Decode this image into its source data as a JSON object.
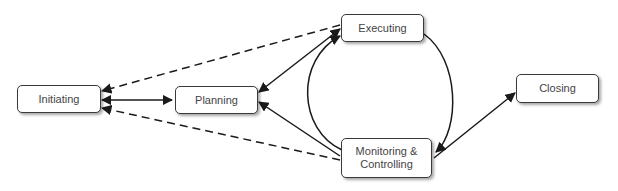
{
  "diagram": {
    "nodes": [
      {
        "id": "initiating",
        "label": "Initiating"
      },
      {
        "id": "planning",
        "label": "Planning"
      },
      {
        "id": "executing",
        "label": "Executing"
      },
      {
        "id": "monitoring",
        "label": "Monitoring & Controlling"
      },
      {
        "id": "closing",
        "label": "Closing"
      }
    ],
    "edges": [
      {
        "from": "initiating",
        "to": "planning",
        "style": "solid",
        "direction": "both"
      },
      {
        "from": "executing",
        "to": "initiating",
        "style": "dashed",
        "direction": "forward"
      },
      {
        "from": "monitoring",
        "to": "initiating",
        "style": "dashed",
        "direction": "forward"
      },
      {
        "from": "planning",
        "to": "executing",
        "style": "solid",
        "direction": "both"
      },
      {
        "from": "monitoring",
        "to": "planning",
        "style": "solid",
        "direction": "forward"
      },
      {
        "from": "executing",
        "to": "monitoring",
        "style": "solid-curve",
        "direction": "forward"
      },
      {
        "from": "monitoring",
        "to": "executing",
        "style": "solid-curve",
        "direction": "forward"
      },
      {
        "from": "monitoring",
        "to": "closing",
        "style": "solid",
        "direction": "forward"
      }
    ],
    "colors": {
      "stroke": "#1a1a1a",
      "node_border": "#3a3a3a",
      "text": "#444444"
    }
  }
}
